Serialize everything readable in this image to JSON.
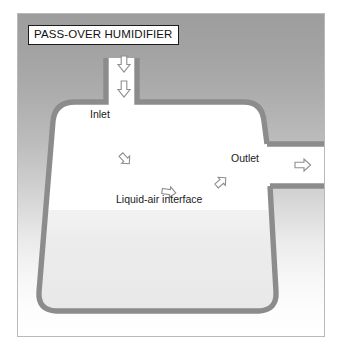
{
  "figure": {
    "title": "PASS-OVER HUMIDIFIER",
    "kind": "technical-diagram"
  },
  "labels": {
    "inlet": "Inlet",
    "outlet": "Outlet",
    "liquid_air_interface": "Liquid-air interface"
  },
  "colors": {
    "vessel_wall": "#8c8c8c",
    "vessel_interior": "#ffffff",
    "liquid_fill": "#ededed",
    "background_top": "#9d9d9d",
    "background_bottom": "#ffffff",
    "frame_border": "#b9b9b9",
    "title_border": "#1b1b1b",
    "arrow_stroke": "#8e8e8e",
    "text": "#1a1a1a"
  },
  "flow_arrows": [
    {
      "name": "inlet-arrow-upper",
      "direction": "down",
      "x": 106,
      "y": 50
    },
    {
      "name": "inlet-arrow-lower",
      "direction": "down",
      "x": 106,
      "y": 75
    },
    {
      "name": "interior-arrow-upper-left",
      "direction": "down-right",
      "x": 107,
      "y": 145
    },
    {
      "name": "interior-arrow-middle",
      "direction": "right",
      "x": 151,
      "y": 178
    },
    {
      "name": "interior-arrow-right",
      "direction": "up-right",
      "x": 203,
      "y": 168
    },
    {
      "name": "outlet-arrow-inner",
      "direction": "right",
      "x": 285,
      "y": 159
    },
    {
      "name": "outlet-arrow-outer",
      "direction": "right",
      "x": 320,
      "y": 159
    }
  ]
}
